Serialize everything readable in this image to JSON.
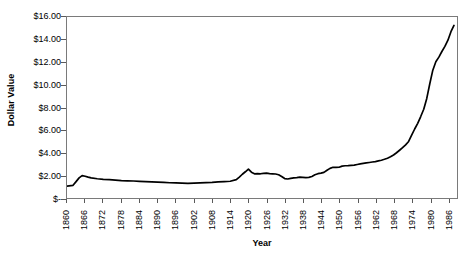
{
  "chart_data": {
    "type": "line",
    "title": "",
    "xlabel": "Year",
    "ylabel": "Dollar Value",
    "xlim": [
      1860,
      1989
    ],
    "ylim": [
      0,
      16
    ],
    "grid": false,
    "legend": "none",
    "y_tick_labels": [
      "$16.00",
      "$14.00",
      "$12.00",
      "$10.00",
      "$8.00",
      "$6.00",
      "$4.00",
      "$2.00",
      "$-"
    ],
    "y_tick_values": [
      16,
      14,
      12,
      10,
      8,
      6,
      4,
      2,
      0
    ],
    "x_tick_labels": [
      "1860",
      "1866",
      "1872",
      "1878",
      "1884",
      "1890",
      "1896",
      "1902",
      "1908",
      "1914",
      "1920",
      "1926",
      "1932",
      "1938",
      "1944",
      "1950",
      "1956",
      "1962",
      "1968",
      "1974",
      "1980",
      "1986"
    ],
    "x_tick_values": [
      1860,
      1866,
      1872,
      1878,
      1884,
      1890,
      1896,
      1902,
      1908,
      1914,
      1920,
      1926,
      1932,
      1938,
      1944,
      1950,
      1956,
      1962,
      1968,
      1974,
      1980,
      1986
    ],
    "series": [
      {
        "name": "Dollar Value",
        "color": "#000000",
        "x": [
          1860,
          1862,
          1863,
          1864,
          1865,
          1866,
          1867,
          1868,
          1870,
          1872,
          1874,
          1876,
          1878,
          1880,
          1882,
          1884,
          1886,
          1888,
          1890,
          1892,
          1894,
          1896,
          1898,
          1900,
          1902,
          1904,
          1906,
          1908,
          1910,
          1912,
          1914,
          1916,
          1917,
          1918,
          1919,
          1920,
          1921,
          1922,
          1923,
          1924,
          1925,
          1926,
          1927,
          1928,
          1929,
          1930,
          1931,
          1932,
          1933,
          1934,
          1935,
          1936,
          1937,
          1938,
          1939,
          1940,
          1941,
          1942,
          1943,
          1944,
          1945,
          1946,
          1947,
          1948,
          1949,
          1950,
          1951,
          1952,
          1953,
          1954,
          1955,
          1956,
          1957,
          1958,
          1959,
          1960,
          1961,
          1962,
          1963,
          1964,
          1965,
          1966,
          1967,
          1968,
          1969,
          1970,
          1971,
          1972,
          1973,
          1974,
          1975,
          1976,
          1977,
          1978,
          1979,
          1980,
          1981,
          1982,
          1983,
          1984,
          1985,
          1986,
          1987,
          1988
        ],
        "y": [
          1.05,
          1.12,
          1.45,
          1.78,
          1.98,
          1.92,
          1.84,
          1.78,
          1.7,
          1.65,
          1.62,
          1.58,
          1.54,
          1.52,
          1.5,
          1.47,
          1.44,
          1.42,
          1.4,
          1.38,
          1.35,
          1.33,
          1.32,
          1.3,
          1.32,
          1.34,
          1.36,
          1.38,
          1.42,
          1.45,
          1.48,
          1.62,
          1.85,
          2.1,
          2.32,
          2.55,
          2.28,
          2.14,
          2.16,
          2.14,
          2.18,
          2.2,
          2.16,
          2.14,
          2.12,
          2.05,
          1.9,
          1.72,
          1.68,
          1.74,
          1.78,
          1.8,
          1.84,
          1.82,
          1.8,
          1.82,
          1.9,
          2.05,
          2.15,
          2.2,
          2.26,
          2.45,
          2.62,
          2.72,
          2.7,
          2.72,
          2.82,
          2.85,
          2.86,
          2.88,
          2.9,
          2.96,
          3.02,
          3.06,
          3.1,
          3.14,
          3.18,
          3.22,
          3.28,
          3.34,
          3.42,
          3.52,
          3.65,
          3.8,
          4.0,
          4.22,
          4.45,
          4.7,
          5.0,
          5.55,
          6.1,
          6.6,
          7.2,
          7.85,
          8.8,
          10.1,
          11.3,
          12.05,
          12.45,
          12.95,
          13.4,
          13.95,
          14.7,
          15.25
        ]
      }
    ]
  },
  "axes": {
    "y_title": "Dollar Value",
    "x_title": "Year"
  }
}
